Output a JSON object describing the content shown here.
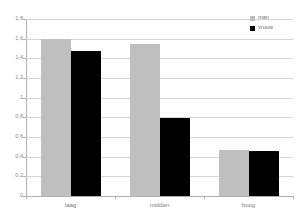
{
  "chart_data": {
    "type": "bar",
    "title": "",
    "subtitle": "",
    "xlabel": "",
    "ylabel": "",
    "categories": [
      "laag",
      "midden",
      "hoog"
    ],
    "series": [
      {
        "name": "man",
        "color": "#bfbfbf",
        "values": [
          1.6,
          1.55,
          0.47
        ]
      },
      {
        "name": "vrouw",
        "color": "#000000",
        "values": [
          1.47,
          0.79,
          0.455
        ]
      }
    ],
    "ylim": [
      0,
      1.8
    ],
    "ytick_values": [
      0,
      0.2,
      0.4,
      0.6,
      0.8,
      1,
      1.2,
      1.4,
      1.6,
      1.8
    ],
    "ytick_labels": [
      "0",
      "0,2",
      "0,4",
      "0,6",
      "0,8",
      "1",
      "1,2",
      "1,4",
      "1,6",
      "1,8"
    ],
    "grid": true,
    "grid_axis": "y",
    "legend_position": "top-right",
    "legend_entries": [
      "man",
      "vrouw"
    ]
  },
  "colors": {
    "series_man": "#bfbfbf",
    "series_vrouw": "#000000",
    "gridline": "#d6d6d6",
    "axis": "#b0b0b0",
    "tick_text": "#8a8a8a",
    "background": "#ffffff"
  }
}
